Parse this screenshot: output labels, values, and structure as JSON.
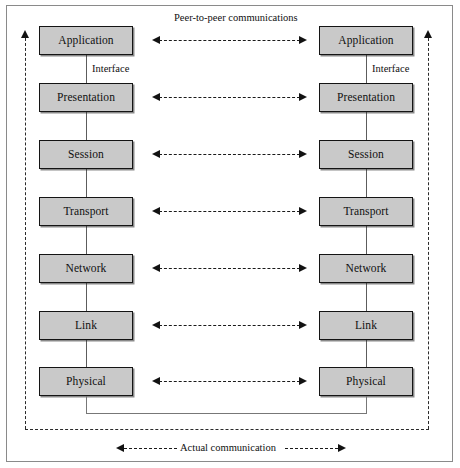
{
  "figure": {
    "title_top": "Peer-to-peer communications",
    "title_bottom": "Actual communication",
    "interface_label": "Interface",
    "box_fill": "#c9c9c9",
    "box_border": "#141414",
    "frame_border": "#8a8a8a",
    "arrow_color": "#121212"
  },
  "layers": [
    {
      "label": "Application"
    },
    {
      "label": "Presentation"
    },
    {
      "label": "Session"
    },
    {
      "label": "Transport"
    },
    {
      "label": "Network"
    },
    {
      "label": "Link"
    },
    {
      "label": "Physical"
    }
  ],
  "left_stack": {
    "name": "left-host",
    "layers": [
      {
        "label": "Application"
      },
      {
        "label": "Presentation"
      },
      {
        "label": "Session"
      },
      {
        "label": "Transport"
      },
      {
        "label": "Network"
      },
      {
        "label": "Link"
      },
      {
        "label": "Physical"
      }
    ]
  },
  "right_stack": {
    "name": "right-host",
    "layers": [
      {
        "label": "Application"
      },
      {
        "label": "Presentation"
      },
      {
        "label": "Session"
      },
      {
        "label": "Transport"
      },
      {
        "label": "Network"
      },
      {
        "label": "Link"
      },
      {
        "label": "Physical"
      }
    ]
  },
  "interfaces": {
    "left_label": "Interface",
    "right_label": "Interface"
  }
}
